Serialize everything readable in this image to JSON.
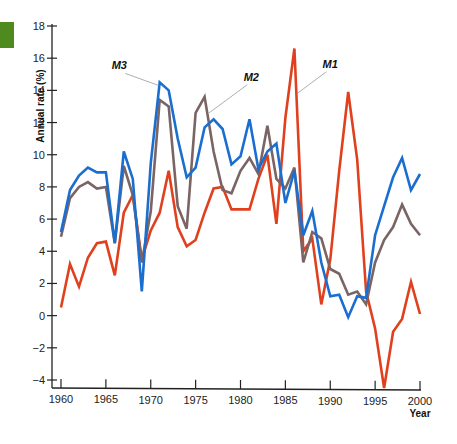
{
  "chart_data": {
    "type": "line",
    "title": "",
    "xlabel": "Year",
    "ylabel": "Annual rate (%)",
    "xlim": [
      1960,
      2000
    ],
    "ylim": [
      -4,
      18
    ],
    "x_ticks": [
      1960,
      1965,
      1970,
      1975,
      1980,
      1985,
      1990,
      1995,
      2000
    ],
    "y_ticks": [
      -4,
      -2,
      0,
      2,
      4,
      6,
      8,
      10,
      12,
      14,
      16,
      18
    ],
    "grid": false,
    "legend": "inline labels with leader lines",
    "x": [
      1960,
      1961,
      1962,
      1963,
      1964,
      1965,
      1966,
      1967,
      1968,
      1969,
      1970,
      1971,
      1972,
      1973,
      1974,
      1975,
      1976,
      1977,
      1978,
      1979,
      1980,
      1981,
      1982,
      1983,
      1984,
      1985,
      1986,
      1987,
      1988,
      1989,
      1990,
      1991,
      1992,
      1993,
      1994,
      1995,
      1996,
      1997,
      1998,
      1999,
      2000
    ],
    "series": [
      {
        "name": "M1",
        "color": "#e0401e",
        "label_pos": {
          "year": 1990,
          "value": 15.4
        },
        "leader_to": {
          "year": 1986.3,
          "value": 13.8
        },
        "values": [
          0.5,
          3.2,
          1.8,
          3.6,
          4.5,
          4.6,
          2.5,
          6.4,
          7.5,
          3.5,
          5.3,
          6.4,
          9.0,
          5.5,
          4.3,
          4.7,
          6.4,
          7.9,
          8.0,
          6.6,
          6.6,
          6.6,
          8.5,
          10.0,
          5.7,
          12.3,
          16.6,
          4.0,
          4.8,
          0.7,
          3.5,
          9.0,
          13.9,
          9.7,
          1.5,
          -0.8,
          -4.5,
          -1.0,
          -0.2,
          2.1,
          0.1
        ]
      },
      {
        "name": "M2",
        "color": "#7a6464",
        "label_pos": {
          "year": 1981.2,
          "value": 14.6
        },
        "leader_to": {
          "year": 1976.5,
          "value": 12.6
        },
        "values": [
          4.9,
          7.3,
          8.0,
          8.3,
          7.9,
          8.0,
          4.5,
          9.3,
          7.5,
          3.3,
          6.5,
          13.4,
          13.0,
          6.8,
          5.4,
          12.6,
          13.6,
          10.2,
          7.8,
          7.6,
          9.0,
          9.8,
          8.8,
          11.8,
          8.5,
          7.9,
          9.2,
          3.3,
          5.2,
          4.8,
          2.9,
          2.6,
          1.3,
          1.5,
          0.7,
          3.3,
          4.7,
          5.5,
          6.9,
          5.7,
          5.0
        ]
      },
      {
        "name": "M3",
        "color": "#1a6ed0",
        "label_pos": {
          "year": 1966.5,
          "value": 15.3
        },
        "leader_to": {
          "year": 1970.9,
          "value": 14.3
        },
        "values": [
          5.2,
          7.8,
          8.7,
          9.2,
          8.9,
          8.9,
          4.5,
          10.2,
          8.5,
          1.5,
          9.5,
          14.5,
          14.0,
          11.0,
          8.6,
          9.2,
          11.7,
          12.2,
          11.6,
          9.4,
          9.9,
          12.2,
          9.1,
          10.2,
          10.7,
          7.0,
          9.0,
          5.0,
          6.5,
          3.3,
          1.2,
          1.3,
          -0.1,
          1.2,
          1.1,
          5.0,
          6.8,
          8.6,
          9.8,
          7.8,
          8.8
        ]
      }
    ]
  },
  "decor": {
    "green_tab_color": "#4e8a1e"
  }
}
